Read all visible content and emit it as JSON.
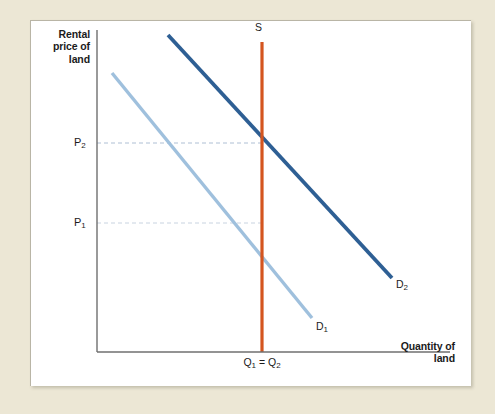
{
  "figure": {
    "background_color": "#ece7d5",
    "panel_color": "#ffffff"
  },
  "axes": {
    "y_title": "Rental\nprice of\nland",
    "x_title": "Quantity of\nland",
    "axis_color": "#6f6f6f"
  },
  "labels": {
    "price_2": "P",
    "price_2_sub": "2",
    "price_1": "P",
    "price_1_sub": "1",
    "quantity_eq": "Q",
    "quantity_eq_sub1": "1",
    "quantity_eq_mid": " = Q",
    "quantity_eq_sub2": "2",
    "supply": "S",
    "demand_1": "D",
    "demand_1_sub": "1",
    "demand_2": "D",
    "demand_2_sub": "2"
  },
  "colors": {
    "demand_1": "#9fc0dd",
    "demand_2": "#2e5f94",
    "supply": "#d4551f",
    "guide_line": "#aebfd4",
    "axis": "#6f6f6f",
    "mat": "#ece7d5"
  },
  "chart_data": {
    "type": "line",
    "xlabel": "Quantity of land",
    "ylabel": "Rental price of land",
    "grid": false,
    "legend": "inline-curve-labels",
    "axis_origin_px": [
      97,
      352
    ],
    "axis_extent_px": {
      "x_end": 450,
      "y_top": 30
    },
    "xlim_labels": [
      "0",
      "Q1 = Q2"
    ],
    "ylim_labels": [
      "0",
      "P1",
      "P2"
    ],
    "series": [
      {
        "name": "D1",
        "label": "D₁",
        "role": "demand-original",
        "color": "#9fc0dd",
        "type": "line",
        "points_px": [
          [
            112,
            73
          ],
          [
            312,
            318
          ]
        ]
      },
      {
        "name": "D2",
        "label": "D₂",
        "role": "demand-shifted",
        "color": "#2e5f94",
        "type": "line",
        "points_px": [
          [
            168,
            35
          ],
          [
            392,
            278
          ]
        ]
      },
      {
        "name": "S",
        "label": "S",
        "role": "supply-fixed-vertical",
        "color": "#d4551f",
        "type": "line",
        "points_px": [
          [
            262,
            42
          ],
          [
            262,
            352
          ]
        ]
      }
    ],
    "equilibria": [
      {
        "name": "E1",
        "price_label": "P1",
        "quantity_label": "Q1",
        "point_px": [
          262,
          223
        ],
        "on_curve": "D1"
      },
      {
        "name": "E2",
        "price_label": "P2",
        "quantity_label": "Q2",
        "point_px": [
          262,
          143
        ],
        "on_curve": "D2"
      }
    ],
    "guide_lines": [
      {
        "from_px": [
          97,
          143
        ],
        "to_px": [
          262,
          143
        ],
        "style": "dashed",
        "for": "P2"
      },
      {
        "from_px": [
          97,
          223
        ],
        "to_px": [
          262,
          223
        ],
        "style": "dashed",
        "for": "P1"
      }
    ],
    "annotation": "Land supply is perfectly inelastic (vertical S). A rightward demand shift from D1 to D2 raises the rental price from P1 to P2 while quantity stays fixed at Q1 = Q2."
  }
}
